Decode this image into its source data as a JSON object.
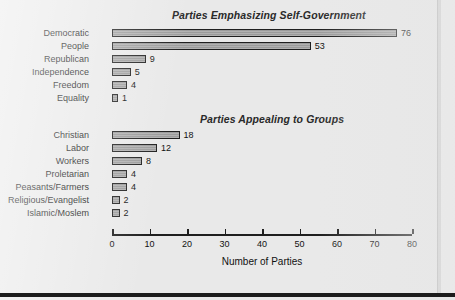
{
  "figure": {
    "background_color": "#e9e9e9",
    "bar_fill_color": "#9b9b9b",
    "bar_border_color": "#1f1f1f",
    "axis_color": "#1f1f1f"
  },
  "chart_data": [
    {
      "type": "bar",
      "orientation": "horizontal",
      "title": "Parties Emphasizing Self-Government",
      "xlabel": "Number of Parties",
      "ylabel": "",
      "xlim": [
        0,
        80
      ],
      "grid": false,
      "legend": "none",
      "categories": [
        "Democratic",
        "People",
        "Republican",
        "Independence",
        "Freedom",
        "Equality"
      ],
      "values": [
        76,
        53,
        9,
        5,
        4,
        1
      ],
      "data_labels": [
        "76",
        "53",
        "9",
        "5",
        "4",
        "1"
      ]
    },
    {
      "type": "bar",
      "orientation": "horizontal",
      "title": "Parties Appealing to Groups",
      "xlabel": "Number of Parties",
      "ylabel": "",
      "xlim": [
        0,
        80
      ],
      "grid": false,
      "legend": "none",
      "categories": [
        "Christian",
        "Labor",
        "Workers",
        "Proletarian",
        "Peasants/Farmers",
        "Religious/Evangelist",
        "Islamic/Moslem"
      ],
      "values": [
        18,
        12,
        8,
        4,
        4,
        2,
        2
      ],
      "data_labels": [
        "18",
        "12",
        "8",
        "4",
        "4",
        "2",
        "2"
      ]
    }
  ],
  "axis": {
    "label": "Number of Parties",
    "ticks": [
      {
        "value": 0,
        "label": "0"
      },
      {
        "value": 10,
        "label": "10"
      },
      {
        "value": 20,
        "label": "20"
      },
      {
        "value": 30,
        "label": "30"
      },
      {
        "value": 40,
        "label": "40"
      },
      {
        "value": 50,
        "label": "50"
      },
      {
        "value": 60,
        "label": "60"
      },
      {
        "value": 70,
        "label": "70"
      },
      {
        "value": 80,
        "label": "80"
      }
    ]
  }
}
